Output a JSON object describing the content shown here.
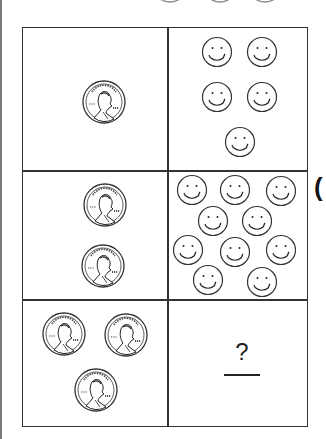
{
  "worksheet": {
    "rows": [
      {
        "pennies": 1,
        "smileys": 5
      },
      {
        "pennies": 2,
        "smileys": 10
      },
      {
        "pennies": 3,
        "smileys": null
      }
    ],
    "answer_placeholder": "?",
    "penny": {
      "motto": "IN GOD WE TRUST",
      "label": "LIBERTY",
      "year": "1991"
    },
    "edge_partial_char": "("
  }
}
